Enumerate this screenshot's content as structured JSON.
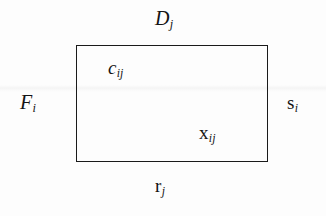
{
  "diagram": {
    "type": "transportation-tableau-cell",
    "background_color": "#fdfdfd",
    "stroke_color": "#1a1a1a",
    "rectangle": {
      "x": 76,
      "y": 45,
      "width": 192,
      "height": 117
    },
    "labels": {
      "top": {
        "base": "D",
        "subscript": "j",
        "full": "Dj",
        "position": "above-top-edge"
      },
      "left": {
        "base": "F",
        "subscript": "i",
        "full": "Fi",
        "position": "left-of-left-edge"
      },
      "right": {
        "base": "s",
        "subscript": "i",
        "full": "si",
        "position": "right-of-right-edge"
      },
      "inner_upper_left": {
        "base": "c",
        "subscript": "ij",
        "full": "cij",
        "position": "inside-upper-left"
      },
      "inner_lower_right": {
        "base": "x",
        "subscript": "ij",
        "full": "xij",
        "position": "inside-lower-right"
      },
      "bottom": {
        "base": "r",
        "subscript": "j",
        "full": "rj",
        "position": "below-bottom-edge"
      }
    }
  }
}
